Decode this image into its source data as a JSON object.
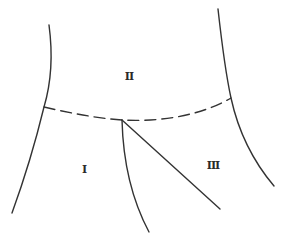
{
  "diagram": {
    "type": "region-partition-sketch",
    "stroke_color": "#333333",
    "background": "#ffffff",
    "regions": [
      {
        "id": "I",
        "label": "I",
        "x": 84,
        "y": 169
      },
      {
        "id": "II",
        "label": "II",
        "x": 129,
        "y": 76
      },
      {
        "id": "III",
        "label": "III",
        "x": 213,
        "y": 165
      }
    ],
    "boundaries": [
      {
        "id": "left-boundary",
        "style": "solid"
      },
      {
        "id": "right-boundary",
        "style": "solid"
      },
      {
        "id": "upper-divider",
        "style": "dashed"
      },
      {
        "id": "lower-left-branch",
        "style": "solid"
      },
      {
        "id": "lower-right-branch",
        "style": "solid"
      }
    ]
  }
}
